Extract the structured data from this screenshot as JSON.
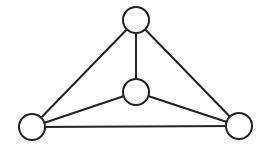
{
  "diagram": {
    "type": "graph",
    "nodes": [
      {
        "id": "top",
        "x": 136,
        "y": 20,
        "r": 13
      },
      {
        "id": "center",
        "x": 136,
        "y": 92,
        "r": 13
      },
      {
        "id": "left",
        "x": 32,
        "y": 127,
        "r": 13
      },
      {
        "id": "right",
        "x": 239,
        "y": 126,
        "r": 13
      }
    ],
    "edges": [
      [
        "top",
        "center"
      ],
      [
        "top",
        "left"
      ],
      [
        "top",
        "right"
      ],
      [
        "center",
        "left"
      ],
      [
        "center",
        "right"
      ],
      [
        "left",
        "right"
      ]
    ],
    "stroke_color": "#222222",
    "fill_color": "#ffffff"
  }
}
